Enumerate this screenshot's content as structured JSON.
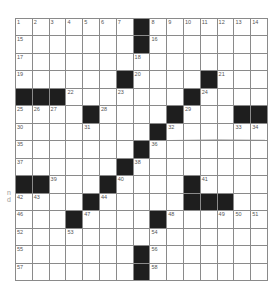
{
  "puzzle": {
    "rows": 15,
    "cols": 15,
    "colors": {
      "black": "#1e1e1e",
      "line": "#8a8a8a",
      "number": "#555555",
      "background": "#ffffff"
    },
    "grid": [
      ".......#.......",
      ".......#.......",
      "...............",
      "......#....#...",
      "###.......#....",
      "....#....#...##",
      "........#......",
      ".......#.......",
      "......#........",
      "##...#....#....",
      "....#.....###..",
      "...#....#......",
      "...............",
      ".......#.......",
      ".......#......."
    ],
    "numbers": [
      {
        "r": 0,
        "c": 0,
        "n": "1"
      },
      {
        "r": 0,
        "c": 1,
        "n": "2"
      },
      {
        "r": 0,
        "c": 2,
        "n": "3"
      },
      {
        "r": 0,
        "c": 3,
        "n": "4"
      },
      {
        "r": 0,
        "c": 4,
        "n": "5"
      },
      {
        "r": 0,
        "c": 5,
        "n": "6"
      },
      {
        "r": 0,
        "c": 6,
        "n": "7"
      },
      {
        "r": 0,
        "c": 8,
        "n": "8"
      },
      {
        "r": 0,
        "c": 9,
        "n": "9"
      },
      {
        "r": 0,
        "c": 10,
        "n": "10"
      },
      {
        "r": 0,
        "c": 11,
        "n": "11"
      },
      {
        "r": 0,
        "c": 12,
        "n": "12"
      },
      {
        "r": 0,
        "c": 13,
        "n": "13"
      },
      {
        "r": 0,
        "c": 14,
        "n": "14"
      },
      {
        "r": 1,
        "c": 0,
        "n": "15"
      },
      {
        "r": 1,
        "c": 8,
        "n": "16"
      },
      {
        "r": 2,
        "c": 0,
        "n": "17"
      },
      {
        "r": 2,
        "c": 7,
        "n": "18"
      },
      {
        "r": 3,
        "c": 0,
        "n": "19"
      },
      {
        "r": 3,
        "c": 7,
        "n": "20"
      },
      {
        "r": 3,
        "c": 12,
        "n": "21"
      },
      {
        "r": 4,
        "c": 3,
        "n": "22"
      },
      {
        "r": 4,
        "c": 6,
        "n": "23"
      },
      {
        "r": 4,
        "c": 11,
        "n": "24"
      },
      {
        "r": 5,
        "c": 0,
        "n": "25"
      },
      {
        "r": 5,
        "c": 1,
        "n": "26"
      },
      {
        "r": 5,
        "c": 2,
        "n": "27"
      },
      {
        "r": 5,
        "c": 5,
        "n": "28"
      },
      {
        "r": 5,
        "c": 10,
        "n": "29"
      },
      {
        "r": 6,
        "c": 0,
        "n": "30"
      },
      {
        "r": 6,
        "c": 4,
        "n": "31"
      },
      {
        "r": 6,
        "c": 9,
        "n": "32"
      },
      {
        "r": 6,
        "c": 13,
        "n": "33"
      },
      {
        "r": 6,
        "c": 14,
        "n": "34"
      },
      {
        "r": 7,
        "c": 0,
        "n": "35"
      },
      {
        "r": 7,
        "c": 8,
        "n": "36"
      },
      {
        "r": 8,
        "c": 0,
        "n": "37"
      },
      {
        "r": 8,
        "c": 7,
        "n": "38"
      },
      {
        "r": 9,
        "c": 2,
        "n": "39"
      },
      {
        "r": 9,
        "c": 6,
        "n": "40"
      },
      {
        "r": 9,
        "c": 11,
        "n": "41"
      },
      {
        "r": 10,
        "c": 0,
        "n": "42"
      },
      {
        "r": 10,
        "c": 1,
        "n": "43"
      },
      {
        "r": 10,
        "c": 5,
        "n": "44"
      },
      {
        "r": 10,
        "c": 10,
        "n": "45"
      },
      {
        "r": 11,
        "c": 0,
        "n": "46"
      },
      {
        "r": 11,
        "c": 4,
        "n": "47"
      },
      {
        "r": 11,
        "c": 9,
        "n": "48"
      },
      {
        "r": 11,
        "c": 12,
        "n": "49"
      },
      {
        "r": 11,
        "c": 13,
        "n": "50"
      },
      {
        "r": 11,
        "c": 14,
        "n": "51"
      },
      {
        "r": 12,
        "c": 0,
        "n": "52"
      },
      {
        "r": 12,
        "c": 3,
        "n": "53"
      },
      {
        "r": 12,
        "c": 8,
        "n": "54"
      },
      {
        "r": 13,
        "c": 0,
        "n": "55"
      },
      {
        "r": 13,
        "c": 8,
        "n": "56"
      },
      {
        "r": 14,
        "c": 0,
        "n": "57"
      },
      {
        "r": 14,
        "c": 8,
        "n": "58"
      }
    ]
  },
  "margin_fragments": [
    {
      "text": "n",
      "x": 7,
      "y": 189
    },
    {
      "text": "d",
      "x": 7,
      "y": 196
    }
  ]
}
